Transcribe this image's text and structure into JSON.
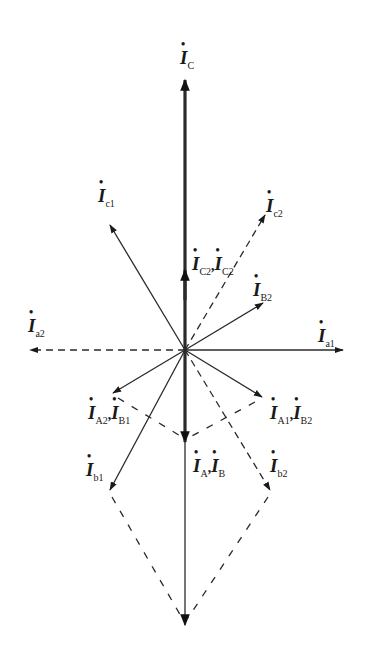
{
  "diagram": {
    "type": "phasor-diagram",
    "origin": [
      185,
      350
    ],
    "colors": {
      "line": "#2a2a2a",
      "background": "#ffffff"
    },
    "labels": {
      "ic": {
        "symbol": "I",
        "sub": "C"
      },
      "ic1": {
        "symbol": "I",
        "sub": "c1"
      },
      "ic2": {
        "symbol": "I",
        "sub": "c2"
      },
      "iC2": {
        "symbol": "I",
        "sub": "C2",
        "sep": ",",
        "symbol2": "I",
        "sub2": "C2"
      },
      "iB2": {
        "symbol": "I",
        "sub": "B2"
      },
      "ia2": {
        "symbol": "I",
        "sub": "a2"
      },
      "ia1": {
        "symbol": "I",
        "sub": "a1"
      },
      "iA2B1": {
        "symbol": "I",
        "sub": "A2",
        "sep": ",",
        "symbol2": "I",
        "sub2": "B1"
      },
      "iA1B2": {
        "symbol": "I",
        "sub": "A1",
        "sep": ",",
        "symbol2": "I",
        "sub2": "B2"
      },
      "iAB": {
        "symbol": "I",
        "sub": "A",
        "sep": ",",
        "symbol2": "I",
        "sub2": "B"
      },
      "ib1": {
        "symbol": "I",
        "sub": "b1"
      },
      "ib2": {
        "symbol": "I",
        "sub": "b2"
      }
    },
    "phasors": [
      {
        "name": "I_C",
        "to": [
          185,
          80
        ],
        "style": "thick"
      },
      {
        "name": "I_C2",
        "to": [
          185,
          270
        ],
        "style": "thick-head"
      },
      {
        "name": "I_c1",
        "to": [
          110,
          225
        ],
        "style": "solid"
      },
      {
        "name": "I_c2",
        "to": [
          265,
          215
        ],
        "style": "dashed"
      },
      {
        "name": "I_B2",
        "to": [
          263,
          303
        ],
        "style": "solid"
      },
      {
        "name": "I_a1",
        "to": [
          343,
          350
        ],
        "style": "solid"
      },
      {
        "name": "I_a2",
        "to": [
          30,
          350
        ],
        "style": "dashed"
      },
      {
        "name": "I_A2,I_B1",
        "to": [
          113,
          393
        ],
        "style": "solid"
      },
      {
        "name": "I_A1,I_B2",
        "to": [
          262,
          397
        ],
        "style": "solid"
      },
      {
        "name": "I_A,I_B",
        "to": [
          185,
          442
        ],
        "style": "thick"
      },
      {
        "name": "I_b1",
        "to": [
          110,
          490
        ],
        "style": "solid"
      },
      {
        "name": "I_b2",
        "to": [
          270,
          490
        ],
        "style": "dashed"
      },
      {
        "name": "sum",
        "to": [
          185,
          625
        ],
        "style": "solid"
      }
    ]
  }
}
